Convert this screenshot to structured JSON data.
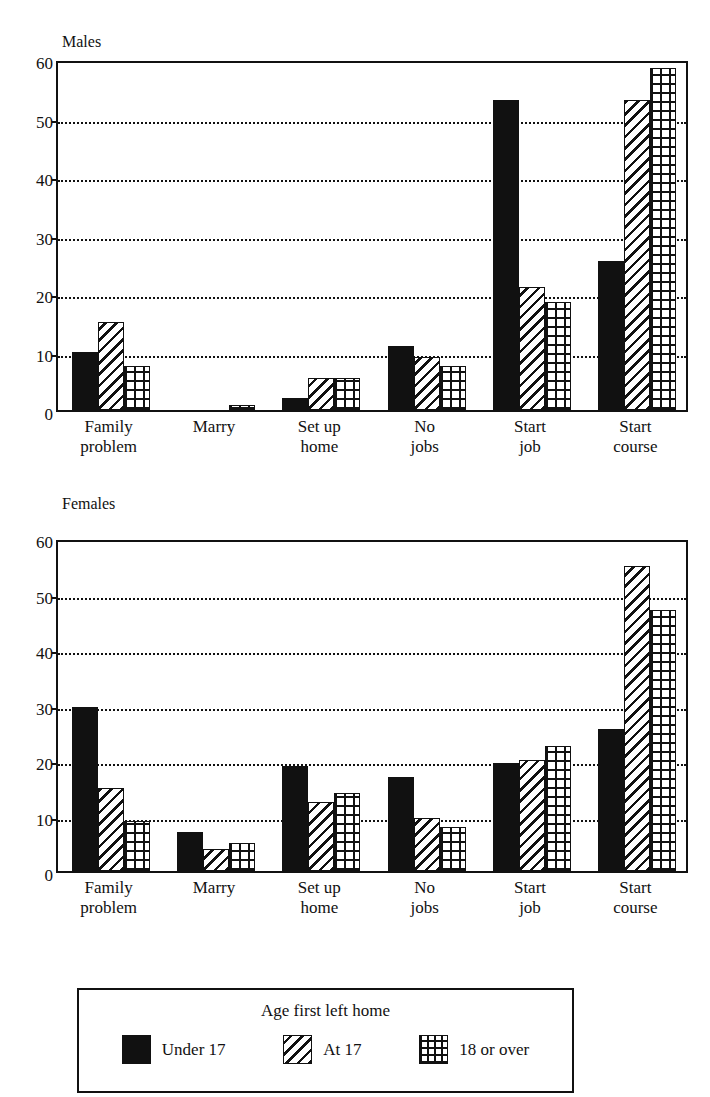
{
  "page": {
    "title": ""
  },
  "legend": {
    "title": "Age first left home",
    "items": [
      {
        "label": "Under 17",
        "pattern": "solid"
      },
      {
        "label": "At 17",
        "pattern": "hatch"
      },
      {
        "label": "18 or over",
        "pattern": "cross"
      }
    ]
  },
  "chart_data": [
    {
      "type": "bar",
      "title": "Males",
      "xlabel": "",
      "ylabel": "",
      "ylim": [
        0,
        60
      ],
      "yticks": [
        0,
        10,
        20,
        30,
        40,
        50,
        60
      ],
      "grid": true,
      "grid_values": [
        10,
        20,
        30,
        40,
        50
      ],
      "legend_position": "bottom",
      "categories": [
        "Family\nproblem",
        "Marry",
        "Set up\nhome",
        "No\njobs",
        "Start\njob",
        "Start\ncourse"
      ],
      "series": [
        {
          "name": "Under 17",
          "pattern": "solid",
          "values": [
            10,
            0,
            2,
            11,
            53,
            25.5
          ]
        },
        {
          "name": "At 17",
          "pattern": "hatch",
          "values": [
            15,
            0,
            5.5,
            9,
            21,
            53
          ]
        },
        {
          "name": "18 or over",
          "pattern": "cross",
          "values": [
            7.5,
            0.8,
            5.5,
            7.5,
            18.5,
            58.5
          ]
        }
      ]
    },
    {
      "type": "bar",
      "title": "Females",
      "xlabel": "",
      "ylabel": "",
      "ylim": [
        0,
        60
      ],
      "yticks": [
        0,
        10,
        20,
        30,
        40,
        50,
        60
      ],
      "grid": true,
      "grid_values": [
        10,
        20,
        30,
        40,
        50
      ],
      "legend_position": "bottom",
      "categories": [
        "Family\nproblem",
        "Marry",
        "Set up\nhome",
        "No\njobs",
        "Start\njob",
        "Start\ncourse"
      ],
      "series": [
        {
          "name": "Under 17",
          "pattern": "solid",
          "values": [
            29.5,
            7,
            19,
            17,
            19.5,
            25.5
          ]
        },
        {
          "name": "At 17",
          "pattern": "hatch",
          "values": [
            15,
            4,
            12.5,
            9.5,
            20,
            55
          ]
        },
        {
          "name": "18 or over",
          "pattern": "cross",
          "values": [
            9,
            5,
            14,
            8,
            22.5,
            47
          ]
        }
      ]
    }
  ]
}
